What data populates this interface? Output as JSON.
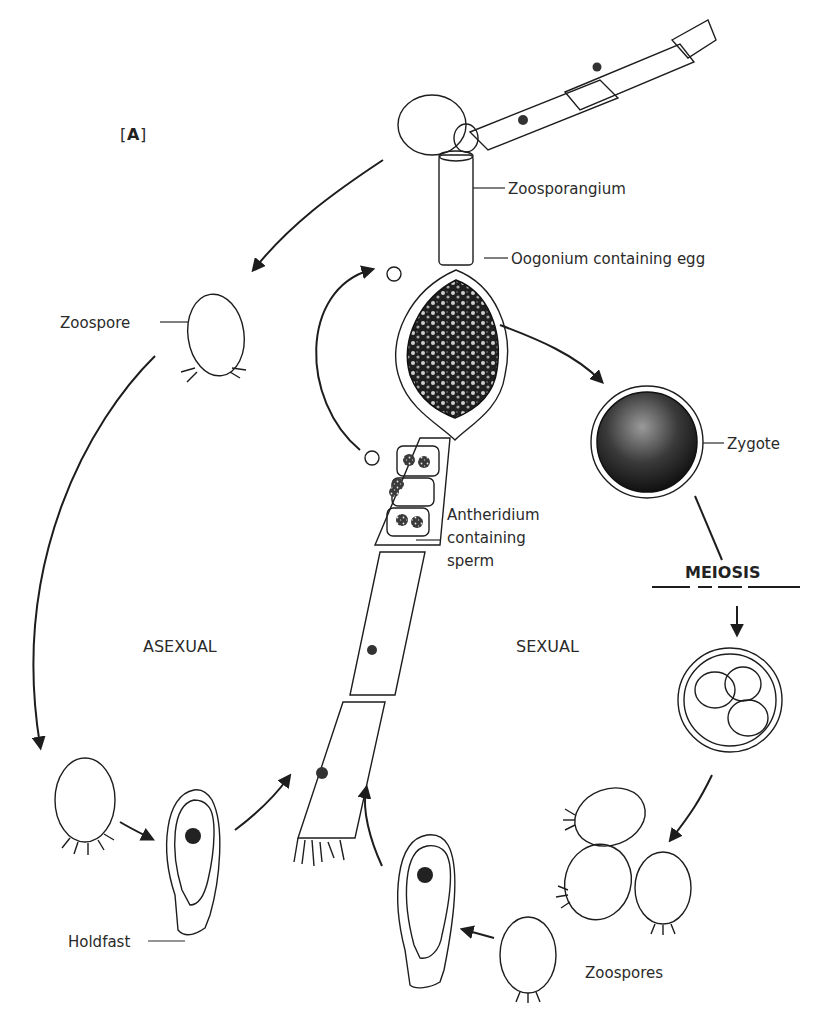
{
  "figure": {
    "panel_label": "[A]",
    "panel_letter": "A",
    "colors": {
      "ink": "#1d1d1d",
      "background": "#ffffff",
      "stipple_dark": "#2b2b2b",
      "stipple_mid": "#7a7a7a",
      "stipple_light": "#c9c9c9"
    }
  },
  "labels": {
    "zoosporangium": "Zoosporangium",
    "oogonium": "Oogonium containing egg",
    "zygote": "Zygote",
    "antheridium_line1": "Antheridium",
    "antheridium_line2": "containing",
    "antheridium_line3": "sperm",
    "meiosis": "MEIOSIS",
    "zoospore": "Zoospore",
    "asexual": "ASEXUAL",
    "sexual": "SEXUAL",
    "holdfast": "Holdfast",
    "zoospores": "Zoospores"
  },
  "stages": [
    {
      "id": "filament",
      "name": "Filament with zoosporangium, oogonium and antheridia"
    },
    {
      "id": "released-zoospore",
      "name": "Zoospore"
    },
    {
      "id": "settled-zoospore",
      "name": "Settling zoospore"
    },
    {
      "id": "germling-left",
      "name": "Germling with holdfast"
    },
    {
      "id": "zygote",
      "name": "Zygote"
    },
    {
      "id": "meiosis-cyst",
      "name": "Cyst with four meiotic products"
    },
    {
      "id": "zoospores-cluster",
      "name": "Zoospores"
    },
    {
      "id": "germling-right",
      "name": "Germling with holdfast"
    }
  ],
  "cycles": [
    "ASEXUAL",
    "SEXUAL"
  ]
}
